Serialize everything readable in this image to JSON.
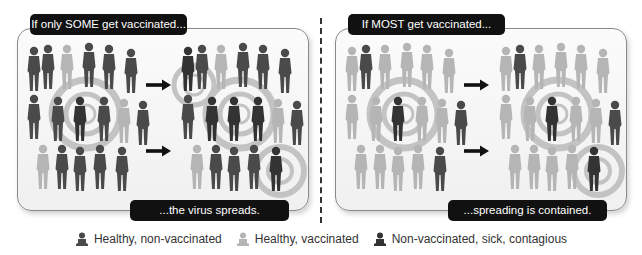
{
  "colors": {
    "non_vaccinated": "#4a4a4a",
    "vaccinated": "#b5b5b5",
    "sick": "#333333",
    "ring": "#bdbdbd",
    "tag_bg": "#111111"
  },
  "panels": [
    {
      "id": "some",
      "title": "If only SOME get vaccinated...",
      "caption": "...the virus spreads."
    },
    {
      "id": "most",
      "title": "If MOST get vaccinated...",
      "caption": "...spreading is contained."
    }
  ],
  "legend": [
    {
      "icon": "person-dark-icon",
      "label": "Healthy, non-vaccinated"
    },
    {
      "icon": "person-light-icon",
      "label": "Healthy, vaccinated"
    },
    {
      "icon": "person-sick-icon",
      "label": "Non-vaccinated, sick, contagious"
    }
  ]
}
